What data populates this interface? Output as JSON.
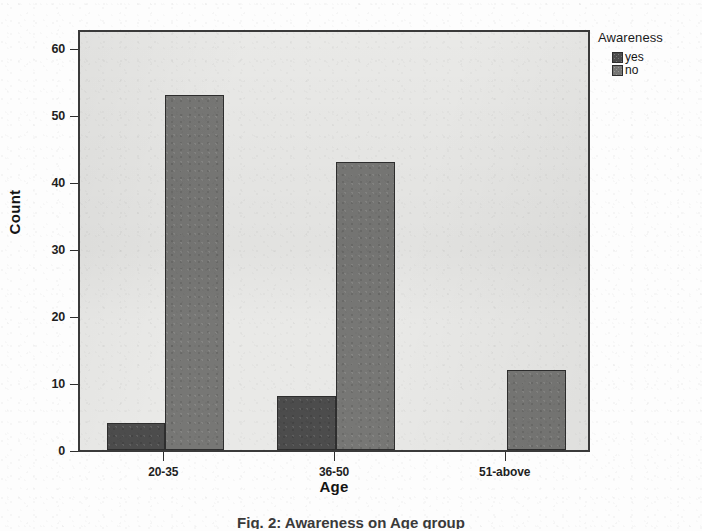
{
  "chart_data": {
    "type": "bar",
    "title": "",
    "subtitle": "",
    "xlabel": "Age",
    "ylabel": "Count",
    "categories": [
      "20-35",
      "36-50",
      "51-above"
    ],
    "series": [
      {
        "name": "yes",
        "color": "#4c4c4c",
        "values": [
          4,
          8,
          0
        ]
      },
      {
        "name": "no",
        "color": "#777775",
        "values": [
          53,
          43,
          12
        ]
      }
    ],
    "ylim": [
      0,
      63
    ],
    "yticks": [
      0,
      10,
      20,
      30,
      40,
      50,
      60
    ],
    "ytick_labels": [
      "0",
      "10",
      "20",
      "30",
      "40",
      "50",
      "60"
    ],
    "grid": false,
    "legend_position": "right-top",
    "legend_title": "Awareness",
    "panel_background": "#e9e9e7",
    "frame_color": "#3a3a3a"
  },
  "axes": {
    "y_title": "Count",
    "x_title": "Age",
    "y_tick_labels": [
      "60",
      "50",
      "40",
      "30",
      "20",
      "10",
      "0"
    ],
    "x_tick_labels": [
      "20-35",
      "36-50",
      "51-above"
    ]
  },
  "legend": {
    "title": "Awareness",
    "entries": [
      {
        "label": "yes",
        "color": "#4c4c4c"
      },
      {
        "label": "no",
        "color": "#777775"
      }
    ]
  },
  "caption": {
    "text": "Fig. 2:  Awareness on Age group"
  }
}
